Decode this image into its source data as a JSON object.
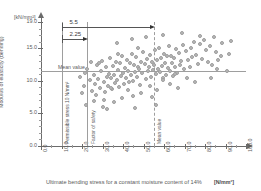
{
  "chart_data": {
    "type": "scatter",
    "title": "",
    "xlabel": "Ultimate bending stress for a constant moisture content of 14%",
    "xunit": "[N/mm²]",
    "ylabel": "Modulus of elasticity (bending)",
    "yunit": "[kN/mm²]",
    "xlim": [
      0,
      100
    ],
    "ylim": [
      0,
      19
    ],
    "grid": false,
    "legend": "none",
    "xticks": [
      "0.0",
      "10.0",
      "20.0",
      "30.0",
      "40.0",
      "50.0",
      "60.0",
      "70.0",
      "80.0",
      "90.0",
      "100.0"
    ],
    "xtick_values": [
      0,
      10,
      20,
      30,
      40,
      50,
      60,
      70,
      80,
      90,
      100
    ],
    "yticks": [
      "0.0",
      "5.0",
      "10.0",
      "15.0",
      "19.0"
    ],
    "ytick_values": [
      0,
      5,
      10,
      15,
      19
    ],
    "reference_lines": [
      {
        "name": "permissible-stress",
        "orientation": "vertical",
        "value": 10,
        "label": "Permissible stress 10 N/mm²"
      },
      {
        "name": "factor-of-safety",
        "orientation": "vertical",
        "value": 22.5,
        "label": "Factor of safety"
      },
      {
        "name": "mean-value-x",
        "orientation": "vertical",
        "value": 55,
        "label": "Mean value"
      },
      {
        "name": "mean-value-y",
        "orientation": "horizontal",
        "value": 11.5,
        "label": "Mean value"
      }
    ],
    "annotations": [
      {
        "name": "dim-5-5",
        "label": "5.5",
        "from": 10,
        "to": 55,
        "at_y": 18.2
      },
      {
        "name": "dim-2-25",
        "label": "2.25",
        "from": 10,
        "to": 22.5,
        "at_y": 16.4
      }
    ],
    "points": [
      [
        20.5,
        9.3
      ],
      [
        22.0,
        12.0
      ],
      [
        23.5,
        10.2
      ],
      [
        24.5,
        8.6
      ],
      [
        25.5,
        11.0
      ],
      [
        26.0,
        9.6
      ],
      [
        27.0,
        12.6
      ],
      [
        27.5,
        10.4
      ],
      [
        28.5,
        9.0
      ],
      [
        29.0,
        11.6
      ],
      [
        29.5,
        13.2
      ],
      [
        30.0,
        10.0
      ],
      [
        30.5,
        8.4
      ],
      [
        31.0,
        12.2
      ],
      [
        31.5,
        10.8
      ],
      [
        32.0,
        9.4
      ],
      [
        32.5,
        11.2
      ],
      [
        33.0,
        13.6
      ],
      [
        33.5,
        10.6
      ],
      [
        34.0,
        8.9
      ],
      [
        34.5,
        12.4
      ],
      [
        35.0,
        11.0
      ],
      [
        35.5,
        9.8
      ],
      [
        36.0,
        13.0
      ],
      [
        36.5,
        10.3
      ],
      [
        37.0,
        11.8
      ],
      [
        37.5,
        9.2
      ],
      [
        38.0,
        12.8
      ],
      [
        38.5,
        10.9
      ],
      [
        39.0,
        14.0
      ],
      [
        39.5,
        11.4
      ],
      [
        40.0,
        9.7
      ],
      [
        40.5,
        12.1
      ],
      [
        41.0,
        10.5
      ],
      [
        41.5,
        13.4
      ],
      [
        42.0,
        11.7
      ],
      [
        42.5,
        9.9
      ],
      [
        43.0,
        12.9
      ],
      [
        43.5,
        11.1
      ],
      [
        44.0,
        14.3
      ],
      [
        44.5,
        10.1
      ],
      [
        45.0,
        12.5
      ],
      [
        45.5,
        11.5
      ],
      [
        46.0,
        13.8
      ],
      [
        46.5,
        10.7
      ],
      [
        47.0,
        12.3
      ],
      [
        47.5,
        11.9
      ],
      [
        48.0,
        9.5
      ],
      [
        48.5,
        13.1
      ],
      [
        49.0,
        11.3
      ],
      [
        49.5,
        14.6
      ],
      [
        50.0,
        12.7
      ],
      [
        50.5,
        10.4
      ],
      [
        51.0,
        13.5
      ],
      [
        51.5,
        11.6
      ],
      [
        52.0,
        12.2
      ],
      [
        52.5,
        14.1
      ],
      [
        53.0,
        10.8
      ],
      [
        53.5,
        13.0
      ],
      [
        54.0,
        11.8
      ],
      [
        54.5,
        12.6
      ],
      [
        55.0,
        14.8
      ],
      [
        55.5,
        11.2
      ],
      [
        56.0,
        13.3
      ],
      [
        56.5,
        12.0
      ],
      [
        57.0,
        15.1
      ],
      [
        57.5,
        11.5
      ],
      [
        58.0,
        13.7
      ],
      [
        58.5,
        12.4
      ],
      [
        59.0,
        10.6
      ],
      [
        59.5,
        14.2
      ],
      [
        60.0,
        12.8
      ],
      [
        60.5,
        11.0
      ],
      [
        61.0,
        13.9
      ],
      [
        61.5,
        12.1
      ],
      [
        62.0,
        15.4
      ],
      [
        62.5,
        11.7
      ],
      [
        63.0,
        14.0
      ],
      [
        63.5,
        12.9
      ],
      [
        64.0,
        10.9
      ],
      [
        64.5,
        13.6
      ],
      [
        65.0,
        12.3
      ],
      [
        65.5,
        15.0
      ],
      [
        66.0,
        11.4
      ],
      [
        67.0,
        14.4
      ],
      [
        67.5,
        12.6
      ],
      [
        68.0,
        13.2
      ],
      [
        69.0,
        15.6
      ],
      [
        69.5,
        12.0
      ],
      [
        70.0,
        14.7
      ],
      [
        71.0,
        13.4
      ],
      [
        72.0,
        12.2
      ],
      [
        72.5,
        15.2
      ],
      [
        73.0,
        13.8
      ],
      [
        74.0,
        16.1
      ],
      [
        75.0,
        14.1
      ],
      [
        76.0,
        12.7
      ],
      [
        77.0,
        15.8
      ],
      [
        78.0,
        13.5
      ],
      [
        79.0,
        16.4
      ],
      [
        80.0,
        14.9
      ],
      [
        81.0,
        13.0
      ],
      [
        82.0,
        15.5
      ],
      [
        83.0,
        12.5
      ],
      [
        84.0,
        16.8
      ],
      [
        85.0,
        14.5
      ],
      [
        86.0,
        13.3
      ],
      [
        88.0,
        15.9
      ],
      [
        90.0,
        11.6
      ],
      [
        92.0,
        16.2
      ],
      [
        18.5,
        10.8
      ],
      [
        19.5,
        8.2
      ],
      [
        21.0,
        11.4
      ],
      [
        24.0,
        13.0
      ],
      [
        26.5,
        8.0
      ],
      [
        28.0,
        12.8
      ],
      [
        33.8,
        9.1
      ],
      [
        37.2,
        14.2
      ],
      [
        41.8,
        8.7
      ],
      [
        46.8,
        15.2
      ],
      [
        52.8,
        9.3
      ],
      [
        58.8,
        10.2
      ],
      [
        64.8,
        11.2
      ],
      [
        70.5,
        10.5
      ],
      [
        44.2,
        7.8
      ],
      [
        39.2,
        7.5
      ],
      [
        48.2,
        8.3
      ],
      [
        56.2,
        8.8
      ],
      [
        62.2,
        9.6
      ],
      [
        30.2,
        7.2
      ],
      [
        35.2,
        6.9
      ],
      [
        53.5,
        7.6
      ],
      [
        66.5,
        9.0
      ],
      [
        74.5,
        10.0
      ],
      [
        82.5,
        10.6
      ],
      [
        36.8,
        16.0
      ],
      [
        43.8,
        16.6
      ],
      [
        50.8,
        16.9
      ],
      [
        59.2,
        17.2
      ],
      [
        68.2,
        17.5
      ],
      [
        77.2,
        17.0
      ],
      [
        85.5,
        12.0
      ],
      [
        87.5,
        13.9
      ],
      [
        91.0,
        14.3
      ],
      [
        21.5,
        6.5
      ],
      [
        25.2,
        7.0
      ],
      [
        31.8,
        5.8
      ],
      [
        29.8,
        6.2
      ],
      [
        45.2,
        6.0
      ],
      [
        55.8,
        6.4
      ]
    ]
  }
}
